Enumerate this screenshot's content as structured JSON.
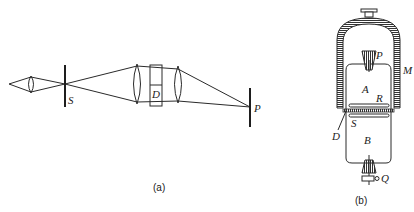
{
  "figure_a": {
    "caption": "(a)",
    "labels": {
      "slit": "S",
      "component": "D",
      "screen": "P"
    }
  },
  "figure_b": {
    "caption": "(b)",
    "labels": {
      "top_plug": "P",
      "outer_shell": "M",
      "upper_chamber": "A",
      "plate": "R",
      "diaphragm": "D",
      "lower_plate": "S",
      "lower_chamber": "B",
      "valve": "Q"
    }
  },
  "colors": {
    "line": "#2a2a2a",
    "background": "#ffffff"
  }
}
